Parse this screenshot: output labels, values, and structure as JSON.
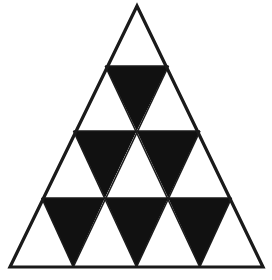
{
  "figure": {
    "type": "geometric-figure",
    "canvas": {
      "width": 272,
      "height": 280,
      "background_color": "#ffffff"
    },
    "colors": {
      "fill_black": "#111111",
      "fill_white": "#ffffff",
      "outline": "#1a1a1a"
    },
    "geometry": {
      "apex": {
        "x": 137,
        "y": 6
      },
      "bottom_left": {
        "x": 10,
        "y": 267
      },
      "bottom_right": {
        "x": 263,
        "y": 267
      },
      "rows": 4,
      "row_baselines_y": [
        6,
        66,
        131,
        198,
        267
      ],
      "outline_stroke_width": 3.2,
      "inner_stroke_width": 1.6,
      "small_triangle_count": 16,
      "upward_count": 10,
      "downward_count": 6,
      "filled_count": 6,
      "unfilled_count": 10
    },
    "rows_detail": [
      {
        "row": 1,
        "cells": 1,
        "cells_detail": [
          {
            "index": 0,
            "orientation": "up",
            "fill": "white"
          }
        ]
      },
      {
        "row": 2,
        "cells": 3,
        "cells_detail": [
          {
            "index": 0,
            "orientation": "up",
            "fill": "white"
          },
          {
            "index": 1,
            "orientation": "down",
            "fill": "black"
          },
          {
            "index": 2,
            "orientation": "up",
            "fill": "white"
          }
        ]
      },
      {
        "row": 3,
        "cells": 5,
        "cells_detail": [
          {
            "index": 0,
            "orientation": "up",
            "fill": "white"
          },
          {
            "index": 1,
            "orientation": "down",
            "fill": "black"
          },
          {
            "index": 2,
            "orientation": "up",
            "fill": "white"
          },
          {
            "index": 3,
            "orientation": "down",
            "fill": "black"
          },
          {
            "index": 4,
            "orientation": "up",
            "fill": "white"
          }
        ]
      },
      {
        "row": 4,
        "cells": 7,
        "cells_detail": [
          {
            "index": 0,
            "orientation": "up",
            "fill": "white"
          },
          {
            "index": 1,
            "orientation": "down",
            "fill": "black"
          },
          {
            "index": 2,
            "orientation": "up",
            "fill": "white"
          },
          {
            "index": 3,
            "orientation": "down",
            "fill": "black"
          },
          {
            "index": 4,
            "orientation": "up",
            "fill": "white"
          },
          {
            "index": 5,
            "orientation": "down",
            "fill": "black"
          },
          {
            "index": 6,
            "orientation": "up",
            "fill": "white"
          }
        ]
      }
    ]
  }
}
